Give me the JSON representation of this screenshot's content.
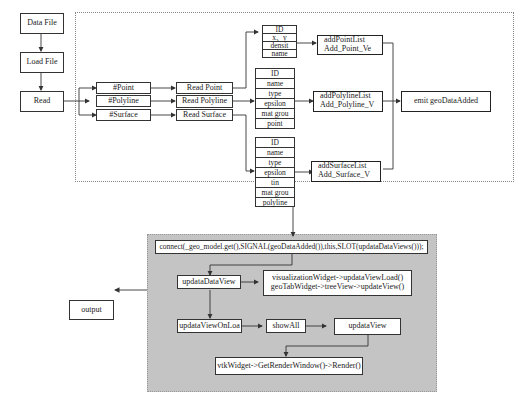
{
  "pipeline": {
    "data_file": "Data File",
    "load_file": "Load File",
    "read": "Read"
  },
  "types": {
    "point": "#Point",
    "polyline": "#Polyline",
    "surface": "#Surface"
  },
  "readers": {
    "point": "Read Point",
    "polyline": "Read Polyline",
    "surface": "Read Surface"
  },
  "fields": {
    "point": [
      "ID",
      "x、y",
      "densit",
      "name"
    ],
    "polyline": [
      "ID",
      "name",
      "type",
      "epsilon",
      "mat grou",
      "point"
    ],
    "surface": [
      "ID",
      "name",
      "type",
      "epsilon",
      "tin",
      "mat grou",
      "polyline"
    ]
  },
  "add_lists": {
    "point": [
      "addPointList",
      "Add_Point_Ve"
    ],
    "polyline": [
      "addPolylineList",
      "Add_Polyline_V"
    ],
    "surface": [
      "addSurfaceList",
      "Add_Surface_V"
    ]
  },
  "emit": "emit geoDataAdded",
  "view_panel": {
    "connect": "connect(_geo_model.get(),SIGNAL(geoDataAdded()),this,SLOT(updataDataViews()));",
    "updata_data_view": "updataDataView",
    "widgets": [
      "visualizationWidget->updataViewLoad()",
      "geoTabWidget->treeView->updateView()"
    ],
    "updata_view_on_load": "updataViewOnLoa",
    "show_all": "showAll",
    "updata_view": "updataView",
    "render": "vtkWidget->GetRenderWindow()->Render()"
  },
  "output": "output",
  "colors": {
    "panel_bg": "#c4c4c4",
    "line": "#333333",
    "box_bg": "#ffffff"
  }
}
